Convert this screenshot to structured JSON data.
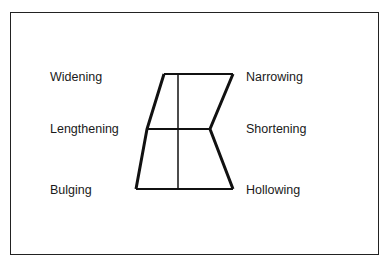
{
  "diagram": {
    "labels_left": [
      "Widening",
      "Lengthening",
      "Bulging"
    ],
    "labels_right": [
      "Narrowing",
      "Shortening",
      "Hollowing"
    ],
    "colors": {
      "line": "#111111",
      "text": "#1a1a1a",
      "background": "#ffffff"
    }
  }
}
